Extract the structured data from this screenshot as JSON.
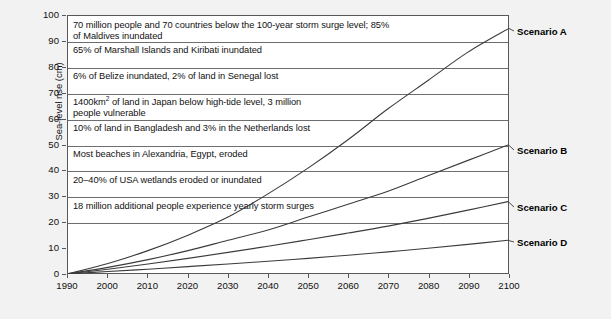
{
  "chart_data": {
    "type": "line",
    "title": "",
    "xlabel": "",
    "ylabel": "Sea-level rise (cm)",
    "xlim": [
      1990,
      2100
    ],
    "ylim": [
      0,
      100
    ],
    "grid": true,
    "legend_position": "right-of-plot-inline-labels",
    "x_tick_labels": [
      "1990",
      "2000",
      "2010",
      "2020",
      "2030",
      "2040",
      "2050",
      "2060",
      "2070",
      "2080",
      "2090",
      "2100"
    ],
    "y_tick_labels": [
      "0",
      "10",
      "20",
      "30",
      "40",
      "50",
      "60",
      "70",
      "80",
      "90",
      "100"
    ],
    "x": [
      1990,
      2000,
      2010,
      2020,
      2030,
      2040,
      2050,
      2060,
      2070,
      2080,
      2090,
      2100
    ],
    "series": [
      {
        "name": "Scenario A",
        "values": [
          0,
          4,
          9,
          15,
          22,
          31,
          41,
          52,
          64,
          75,
          86,
          95
        ]
      },
      {
        "name": "Scenario B",
        "values": [
          0,
          2.5,
          5.5,
          9,
          13,
          17,
          22,
          27,
          32,
          38,
          44,
          50
        ]
      },
      {
        "name": "Scenario C",
        "values": [
          0,
          1.8,
          3.8,
          6,
          8.3,
          10.7,
          13.2,
          15.8,
          18.5,
          21.5,
          24.7,
          28
        ]
      },
      {
        "name": "Scenario D",
        "values": [
          0,
          0.9,
          1.8,
          2.8,
          3.8,
          4.9,
          6.0,
          7.2,
          8.5,
          9.9,
          11.4,
          13
        ]
      }
    ],
    "annotations": [
      {
        "band_range": [
          90,
          100
        ],
        "text_lines": [
          "70 million people and 70 countries below the 100-year storm surge level; 85%",
          "of Maldives inundated"
        ]
      },
      {
        "band_range": [
          80,
          90
        ],
        "text_lines": [
          "65% of Marshall Islands and Kiribati inundated"
        ]
      },
      {
        "band_range": [
          70,
          80
        ],
        "text_lines": [
          "6% of Belize inundated, 2% of land in Senegal lost"
        ]
      },
      {
        "band_range": [
          60,
          70
        ],
        "text_lines": [
          "1400km{sup:2} of land in Japan below high-tide level, 3 million",
          "people vulnerable"
        ]
      },
      {
        "band_range": [
          50,
          60
        ],
        "text_lines": [
          "10% of land in Bangladesh and 3% in the Netherlands lost"
        ]
      },
      {
        "band_range": [
          40,
          50
        ],
        "text_lines": [
          "Most beaches in Alexandria, Egypt, eroded"
        ]
      },
      {
        "band_range": [
          30,
          40
        ],
        "text_lines": [
          "20–40% of USA wetlands eroded or inundated"
        ]
      },
      {
        "band_range": [
          20,
          30
        ],
        "text_lines": [
          "18 million additional people experience yearly storm surges"
        ]
      }
    ]
  },
  "axes": {
    "y_title": "Sea-level rise (cm)",
    "y_ticks": [
      "100",
      "90",
      "80",
      "70",
      "60",
      "50",
      "40",
      "30",
      "20",
      "10",
      "0"
    ],
    "x_ticks": [
      "1990",
      "2000",
      "2010",
      "2020",
      "2030",
      "2040",
      "2050",
      "2060",
      "2070",
      "2080",
      "2090",
      "2100"
    ]
  },
  "annotation_text": {
    "row_1_line_1": "70 million people and 70 countries below the 100-year storm surge level; 85%",
    "row_1_line_2": "of Maldives inundated",
    "row_2_line_1": "65% of Marshall Islands and Kiribati inundated",
    "row_3_line_1": "6% of Belize inundated, 2% of land in Senegal lost",
    "row_4_line_1_pre": "1400km",
    "row_4_line_1_sup": "2",
    "row_4_line_1_post": " of land in Japan below high-tide level, 3 million",
    "row_4_line_2": "people vulnerable",
    "row_5_line_1": "10% of land in Bangladesh and 3% in the Netherlands lost",
    "row_6_line_1": "Most beaches in Alexandria, Egypt, eroded",
    "row_7_line_1": "20–40% of USA wetlands eroded or inundated",
    "row_8_line_1": "18 million additional people experience yearly storm surges"
  },
  "scenario_labels": {
    "a": "Scenario A",
    "b": "Scenario B",
    "c": "Scenario C",
    "d": "Scenario D"
  },
  "colors": {
    "plot_background": "#ffffff",
    "page_background": "#f2f2f2",
    "axis_line": "#58585a",
    "gridline": "#6d6e70",
    "series_line": "#3b3b3d",
    "text": "#111111"
  }
}
